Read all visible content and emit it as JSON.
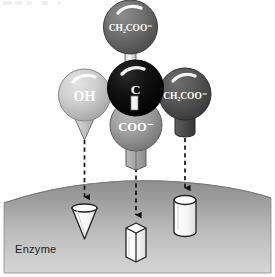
{
  "figure": {
    "background_color": "#ffffff",
    "top_fragment_text": "",
    "enzyme": {
      "label": "Enzyme",
      "surface_color_top": "#9a9a9a",
      "surface_color_bottom": "#d2d2d2",
      "border_color": "#7d7d7d"
    },
    "central_atom": {
      "label": "C",
      "color": "#0d0d0d",
      "highlight_color": "#ffffff",
      "label_color": "#ffffff"
    },
    "bond_color": "#efefef",
    "bond_outline": "#5a5a5a",
    "groups": [
      {
        "id": "top",
        "label": "CH₂COO⁻",
        "label_plain": "CH2COO-",
        "sphere_color": "#6e6e6e",
        "sphere_outline": "#3c3c3c",
        "position": "top",
        "shape": "none",
        "has_arrow": false
      },
      {
        "id": "left",
        "label": "OH",
        "label_plain": "OH",
        "sphere_color": "#cfcfcf",
        "sphere_outline": "#8a8a8a",
        "position": "left",
        "shape": "cone",
        "shape_color": "#c9c9c9",
        "has_arrow": true,
        "binding_site": "cone"
      },
      {
        "id": "bottom",
        "label": "COO⁻",
        "label_plain": "COO-",
        "sphere_color": "#9e9e9e",
        "sphere_outline": "#5e5e5e",
        "position": "bottom",
        "shape": "hex-prism",
        "shape_color": "#adadad",
        "has_arrow": true,
        "binding_site": "hex-prism"
      },
      {
        "id": "right",
        "label": "CH₂COO⁻",
        "label_plain": "CH2COO-",
        "sphere_color": "#575757",
        "sphere_outline": "#2f2f2f",
        "position": "right",
        "shape": "cylinder",
        "shape_color": "#4d4d4d",
        "has_arrow": true,
        "binding_site": "cylinder"
      }
    ],
    "binding_sites": [
      {
        "id": "site-cone",
        "shape": "cone",
        "fill": "#fbfbfb",
        "outline": "#2b2b2b"
      },
      {
        "id": "site-hex",
        "shape": "hex-prism",
        "fill": "#fbfbfb",
        "outline": "#2b2b2b"
      },
      {
        "id": "site-cylinder",
        "shape": "cylinder",
        "fill": "#fbfbfb",
        "outline": "#2b2b2b"
      }
    ],
    "arrows": {
      "count": 3,
      "style": "dashed",
      "color": "#1a1a1a",
      "direction": "down"
    }
  }
}
